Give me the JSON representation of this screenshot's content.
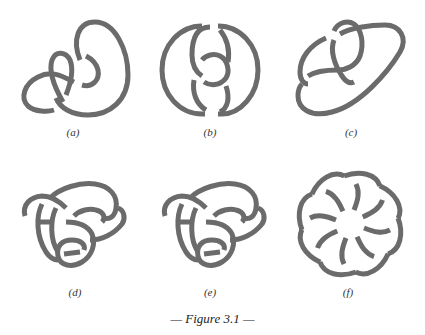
{
  "figure": {
    "caption": "— Figure 3.1 —",
    "stroke_color": "#6b6b6b",
    "background": "#ffffff",
    "panels": [
      {
        "id": "a",
        "label": "(a)"
      },
      {
        "id": "b",
        "label": "(b)"
      },
      {
        "id": "c",
        "label": "(c)"
      },
      {
        "id": "d",
        "label": "(d)"
      },
      {
        "id": "e",
        "label": "(e)"
      },
      {
        "id": "f",
        "label": "(f)"
      }
    ]
  }
}
